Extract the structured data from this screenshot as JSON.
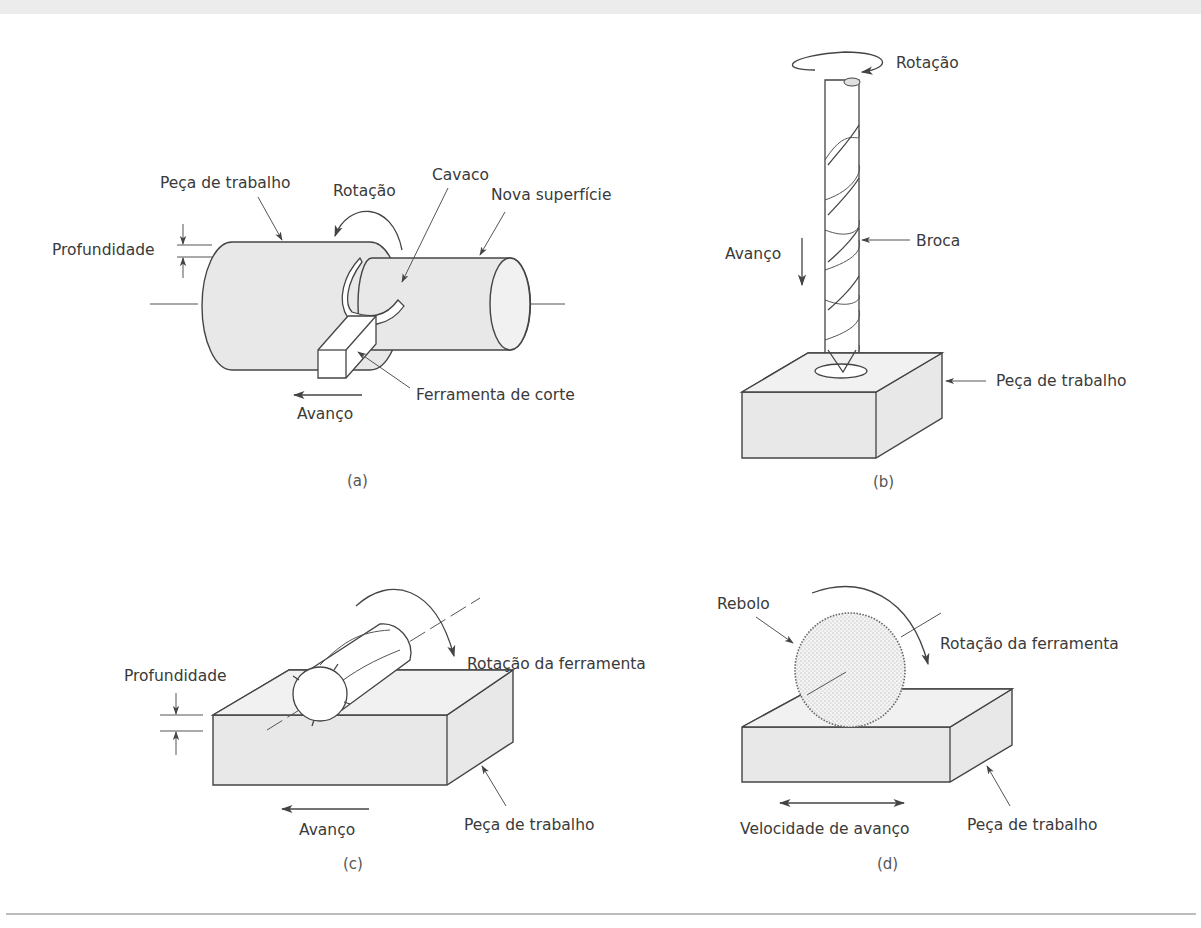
{
  "figure": {
    "panels": [
      {
        "id": "a",
        "caption": "(a)",
        "process": "turning",
        "labels": {
          "workpiece": "Peça de trabalho",
          "rotation": "Rotação",
          "chip": "Cavaco",
          "new_surface": "Nova superfície",
          "depth": "Profundidade",
          "cutting_tool": "Ferramenta de corte",
          "feed": "Avanço"
        }
      },
      {
        "id": "b",
        "caption": "(b)",
        "process": "drilling",
        "labels": {
          "rotation": "Rotação",
          "drill": "Broca",
          "feed": "Avanço",
          "workpiece": "Peça de trabalho"
        }
      },
      {
        "id": "c",
        "caption": "(c)",
        "process": "milling",
        "labels": {
          "tool_rotation": "Rotação da ferramenta",
          "depth": "Profundidade",
          "feed": "Avanço",
          "workpiece": "Peça de trabalho"
        }
      },
      {
        "id": "d",
        "caption": "(d)",
        "process": "grinding",
        "labels": {
          "wheel": "Rebolo",
          "tool_rotation": "Rotação da ferramenta",
          "feed_speed": "Velocidade de avanço",
          "workpiece": "Peça de trabalho"
        }
      }
    ]
  }
}
